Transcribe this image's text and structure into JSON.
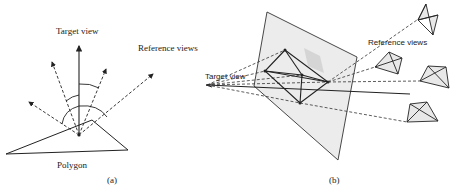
{
  "figure_a": {
    "target_view_label": "Target view",
    "reference_views_label": "Reference views",
    "polygon_label": "Polygon",
    "caption": "(a)"
  },
  "figure_b": {
    "target_view_label": "Target view",
    "reference_views_label": "Reference views",
    "caption": "(b)"
  },
  "colors": {
    "stroke": "#222222",
    "plane_fill": "#ececec",
    "cube_fill": "#d6d6d6",
    "camera_fill": "#e8e8e8"
  }
}
